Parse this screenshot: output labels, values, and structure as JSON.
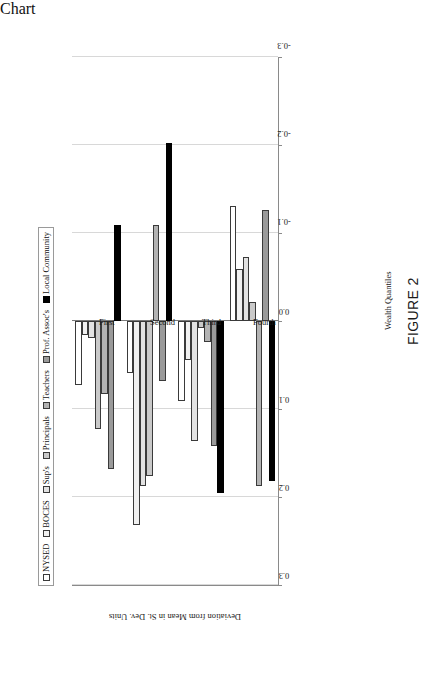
{
  "figure": {
    "caption": "FIGURE 2",
    "xaxis_caption": "Wealth Quantiles"
  },
  "legend": {
    "position": "top",
    "items": [
      {
        "label": "NYSED",
        "color": "#ffffff"
      },
      {
        "label": "BOCES",
        "color": "#f0f0f0"
      },
      {
        "label": "Sup's",
        "color": "#e2e2e2"
      },
      {
        "label": "Principals",
        "color": "#c9c9c9"
      },
      {
        "label": "Teachers",
        "color": "#b3b3b3"
      },
      {
        "label": "Prof. Assoc's",
        "color": "#9a9a9a"
      },
      {
        "label": "Local Community",
        "color": "#000000"
      }
    ]
  },
  "chart_data": {
    "type": "bar",
    "orientation": "horizontal-rotated",
    "title": "",
    "xlabel": "Wealth Quantiles",
    "ylabel": "Deviation from Mean in St. Dev. Units",
    "ylim": [
      -0.3,
      0.3
    ],
    "yticks": [
      0.3,
      0.2,
      0.1,
      0.0,
      -0.1,
      -0.2,
      -0.3
    ],
    "ytick_labels": [
      "0.3",
      "0.2",
      "0.1",
      "0.0",
      "-0.1",
      "-0.2",
      "-0.3"
    ],
    "grid": true,
    "categories": [
      "First",
      "Second",
      "Third",
      "Fourth"
    ],
    "series": [
      {
        "name": "NYSED",
        "values": [
          0.073,
          0.059,
          0.091,
          -0.131
        ]
      },
      {
        "name": "BOCES",
        "values": [
          0.016,
          0.232,
          0.044,
          -0.059
        ]
      },
      {
        "name": "Sup's",
        "values": [
          0.019,
          0.187,
          0.136,
          -0.073
        ]
      },
      {
        "name": "Principals",
        "values": [
          0.123,
          0.176,
          0.008,
          -0.022
        ]
      },
      {
        "name": "Teachers",
        "values": [
          0.083,
          -0.109,
          0.024,
          0.187
        ]
      },
      {
        "name": "Prof. Assoc's",
        "values": [
          0.168,
          0.068,
          0.142,
          -0.126
        ]
      },
      {
        "name": "Local Community",
        "values": [
          -0.109,
          -0.202,
          0.196,
          0.182
        ]
      }
    ]
  }
}
